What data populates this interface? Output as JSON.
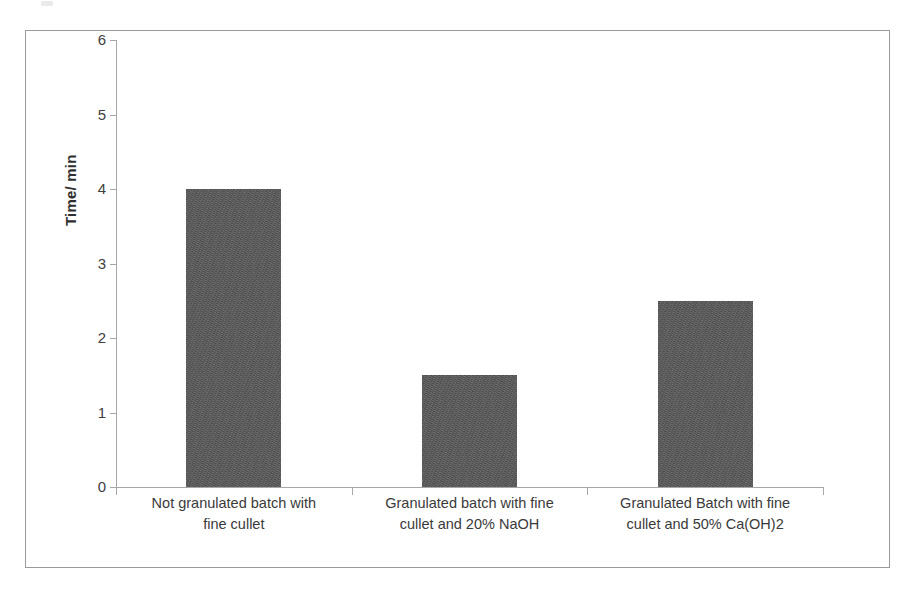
{
  "figure": {
    "background_color": "#ffffff",
    "border_color": "#9a9a9a",
    "axis_color": "#a6a6a6",
    "bar_color": "#595959",
    "tick_label_color": "#404040"
  },
  "chart_data": {
    "type": "bar",
    "title": "",
    "subtitle": "",
    "xlabel": "",
    "ylabel": "Time/ min",
    "ylim": [
      0,
      6
    ],
    "yticks": [
      0,
      1,
      2,
      3,
      4,
      5,
      6
    ],
    "ytick_labels": [
      "0",
      "1",
      "2",
      "3",
      "4",
      "5",
      "6"
    ],
    "grid": false,
    "legend": false,
    "legend_position": "none",
    "categories": [
      "Not granulated batch with fine cullet",
      "Granulated batch with fine cullet and 20% NaOH",
      "Granulated Batch with fine cullet and  50% Ca(OH)2"
    ],
    "category_lines": [
      [
        "Not granulated batch with",
        "fine cullet"
      ],
      [
        "Granulated batch with fine",
        "cullet and 20% NaOH"
      ],
      [
        "Granulated Batch with fine",
        "cullet and  50% Ca(OH)2"
      ]
    ],
    "values": [
      4,
      1.5,
      2.5
    ],
    "units": "min",
    "annotations": []
  }
}
